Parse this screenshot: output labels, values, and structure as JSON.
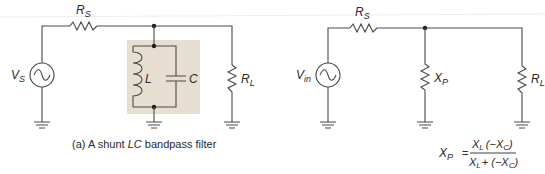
{
  "colors": {
    "wire": "#4a4a4a",
    "tank_background": "#e6ded0",
    "text": "#2a2a2a",
    "page": "#ffffff"
  },
  "left_circuit": {
    "source": {
      "label_main": "V",
      "label_sub": "S",
      "icon": "ac-source-icon"
    },
    "series_resistor": {
      "label_main": "R",
      "label_sub": "S"
    },
    "tank": {
      "inductor": {
        "label": "L"
      },
      "capacitor": {
        "label": "C"
      }
    },
    "load_resistor": {
      "label_main": "R",
      "label_sub": "L"
    },
    "caption": {
      "prefix": "(a) A shunt ",
      "emphasis": "LC",
      "suffix": " bandpass filter"
    }
  },
  "right_circuit": {
    "source": {
      "label_main": "V",
      "label_sub": "in",
      "icon": "ac-source-icon"
    },
    "series_resistor": {
      "label_main": "R",
      "label_sub": "S"
    },
    "shunt_reactance": {
      "label_main": "X",
      "label_sub": "P"
    },
    "load_resistor": {
      "label_main": "R",
      "label_sub": "L"
    },
    "formula": {
      "lhs_main": "X",
      "lhs_sub": "P",
      "equals": "=",
      "num_a_main": "X",
      "num_a_sub": "L",
      "num_b": "(−X",
      "num_b_sub": "C",
      "num_close": ")",
      "den_a_main": "X",
      "den_a_sub": "L",
      "den_plus": "+ (−X",
      "den_sub": "C",
      "den_close": ")"
    }
  }
}
